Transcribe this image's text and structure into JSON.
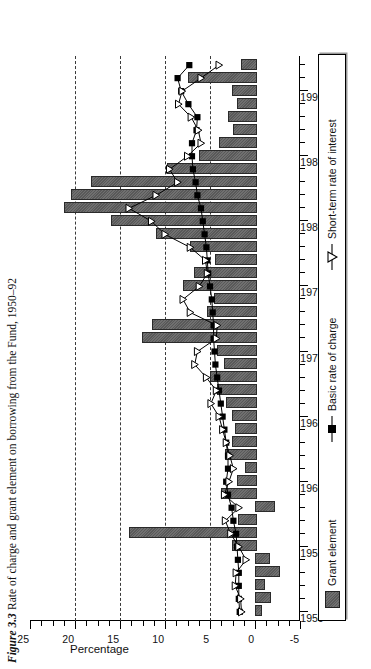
{
  "title": {
    "prefix": "Figure 3.3",
    "text": "Rate of charge and grant element on borrowing from the Fund, 1950–92"
  },
  "axes": {
    "ylabel": "Percentage",
    "yticks": [
      "25",
      "20",
      "15",
      "10",
      "5",
      "0",
      "-5"
    ],
    "xticks": [
      "1950",
      "1955",
      "1960",
      "1965",
      "1970",
      "1975",
      "1980",
      "1985",
      "1990"
    ]
  },
  "legend": {
    "items": [
      {
        "label": "Grant element",
        "marker": "filled-square-swatch",
        "color": "#595959"
      },
      {
        "label": "Basic rate of charge",
        "marker": "line-square",
        "color": "#000000"
      },
      {
        "label": "Short-term rate of interest",
        "marker": "line-triangle",
        "color": "#000000"
      }
    ]
  },
  "chart_data": {
    "type": "bar",
    "title": "Figure 3.3 Rate of charge and grant element on borrowing from the Fund, 1950–92",
    "xlabel": "",
    "ylabel": "Percentage",
    "ylim": [
      -5,
      25
    ],
    "xlim": [
      1949.3,
      1992.7
    ],
    "grid": "dashed vertical gridlines at 5, 10, 15, 20",
    "legend_position": "bottom",
    "orientation": "rotated-90-horizontal-bars",
    "years": [
      1950,
      1951,
      1952,
      1953,
      1954,
      1955,
      1956,
      1957,
      1958,
      1959,
      1960,
      1961,
      1962,
      1963,
      1964,
      1965,
      1966,
      1967,
      1968,
      1969,
      1970,
      1971,
      1972,
      1973,
      1974,
      1975,
      1976,
      1977,
      1978,
      1979,
      1980,
      1981,
      1982,
      1983,
      1984,
      1985,
      1986,
      1987,
      1988,
      1989,
      1990,
      1991,
      1992
    ],
    "series": [
      {
        "name": "Grant element",
        "type": "bar",
        "values": [
          -0.6,
          -1.6,
          -0.9,
          -2.6,
          -1.4,
          2.6,
          14.0,
          1.9,
          -2.0,
          3.8,
          2.0,
          1.1,
          3.3,
          2.6,
          2.2,
          2.6,
          3.2,
          4.2,
          5.0,
          3.4,
          4.2,
          12.6,
          11.5,
          5.3,
          4.6,
          8.0,
          6.8,
          4.5,
          7.2,
          11.0,
          16.0,
          21.2,
          20.4,
          18.2,
          9.8,
          6.2,
          4.0,
          2.4,
          3.0,
          2.0,
          2.6,
          7.5,
          1.6
        ]
      },
      {
        "name": "Basic rate of charge",
        "type": "line",
        "marker": "filled-square",
        "values": [
          1.7,
          1.8,
          1.8,
          1.8,
          1.9,
          2.0,
          2.1,
          2.4,
          2.6,
          3.0,
          3.2,
          3.0,
          3.0,
          3.2,
          3.4,
          3.6,
          3.8,
          4.0,
          4.2,
          4.4,
          4.5,
          4.6,
          4.6,
          4.7,
          4.8,
          5.0,
          5.2,
          5.3,
          5.4,
          5.6,
          5.8,
          6.0,
          6.4,
          6.6,
          6.9,
          7.0,
          7.0,
          6.5,
          6.4,
          7.4,
          8.2,
          8.6,
          7.3
        ]
      },
      {
        "name": "Short-term rate of interest",
        "type": "line",
        "marker": "open-triangle",
        "values": [
          1.5,
          1.6,
          2.2,
          2.1,
          1.0,
          1.8,
          2.7,
          3.3,
          1.8,
          3.4,
          2.9,
          2.4,
          2.8,
          3.2,
          3.6,
          4.0,
          4.9,
          4.3,
          5.4,
          6.7,
          6.4,
          4.3,
          4.2,
          7.2,
          8.0,
          6.2,
          5.3,
          5.5,
          7.2,
          10.0,
          11.5,
          14.0,
          11.0,
          8.6,
          9.5,
          7.5,
          6.0,
          6.3,
          7.1,
          8.5,
          8.1,
          6.0,
          4.0
        ]
      }
    ]
  }
}
